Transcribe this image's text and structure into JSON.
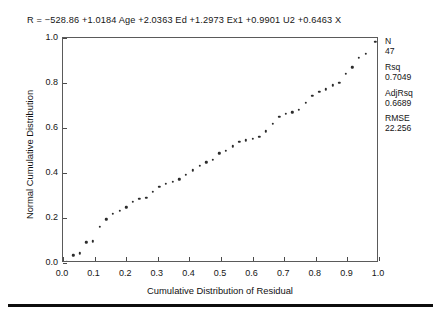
{
  "equation": "R  =  −528.86  +1.0184 Age  +2.0363 Ed  +1.2973 Ex1  +0.9901 U2  +0.6463 X",
  "stats": [
    {
      "key": "N",
      "value": "47"
    },
    {
      "key": "Rsq",
      "value": "0.7049"
    },
    {
      "key": "AdjRsq",
      "value": "0.6689"
    },
    {
      "key": "RMSE",
      "value": "22.256"
    }
  ],
  "chart_data": {
    "type": "scatter",
    "title": "",
    "xlabel": "Cumulative Distribution of Residual",
    "ylabel": "Normal Cumulative Distribution",
    "xlim": [
      0.0,
      1.0
    ],
    "ylim": [
      0.0,
      1.0
    ],
    "grid": false,
    "legend": null,
    "marker": "dot",
    "marker_color": "#2b2b2b",
    "xticks": [
      "0.0",
      "0.1",
      "0.2",
      "0.3",
      "0.4",
      "0.5",
      "0.6",
      "0.7",
      "0.8",
      "0.9",
      "1.0"
    ],
    "xtick_values": [
      0.0,
      0.1,
      0.2,
      0.3,
      0.4,
      0.5,
      0.6,
      0.7,
      0.8,
      0.9,
      1.0
    ],
    "yticks": [
      "0.0",
      "0.2",
      "0.4",
      "0.6",
      "0.8",
      "1.0"
    ],
    "ytick_values": [
      0.0,
      0.2,
      0.4,
      0.6,
      0.8,
      1.0
    ],
    "n_points": 47,
    "x": [
      0.012,
      0.032,
      0.053,
      0.074,
      0.095,
      0.116,
      0.137,
      0.158,
      0.179,
      0.2,
      0.221,
      0.242,
      0.263,
      0.284,
      0.305,
      0.326,
      0.347,
      0.368,
      0.389,
      0.411,
      0.432,
      0.453,
      0.474,
      0.495,
      0.516,
      0.537,
      0.558,
      0.579,
      0.6,
      0.621,
      0.642,
      0.663,
      0.684,
      0.705,
      0.726,
      0.747,
      0.768,
      0.789,
      0.811,
      0.832,
      0.853,
      0.874,
      0.895,
      0.916,
      0.937,
      0.958,
      0.988
    ],
    "y": [
      0.005,
      0.035,
      0.043,
      0.092,
      0.097,
      0.16,
      0.195,
      0.218,
      0.233,
      0.248,
      0.272,
      0.285,
      0.29,
      0.317,
      0.34,
      0.352,
      0.362,
      0.372,
      0.392,
      0.412,
      0.432,
      0.448,
      0.46,
      0.487,
      0.5,
      0.518,
      0.54,
      0.545,
      0.553,
      0.562,
      0.585,
      0.618,
      0.65,
      0.662,
      0.67,
      0.682,
      0.712,
      0.742,
      0.762,
      0.772,
      0.79,
      0.8,
      0.84,
      0.87,
      0.912,
      0.93,
      0.982
    ]
  }
}
